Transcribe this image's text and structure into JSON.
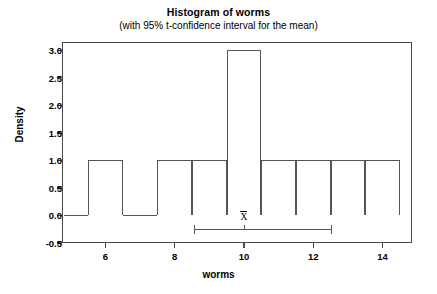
{
  "chart_data": {
    "type": "bar",
    "title": "Histogram of worms",
    "subtitle": "(with 95% t-confidence interval for the mean)",
    "xlabel": "worms",
    "ylabel": "Density",
    "xlim": [
      4.75,
      14.85
    ],
    "ylim": [
      -0.5,
      3.15
    ],
    "grid": false,
    "legend": null,
    "bin_width": 1,
    "bin_edges": [
      5.5,
      6.5,
      7.5,
      8.5,
      9.5,
      10.5,
      11.5,
      12.5,
      13.5,
      14.5
    ],
    "bins": [
      {
        "left": 5.5,
        "right": 6.5,
        "density": 1.0
      },
      {
        "left": 6.5,
        "right": 7.5,
        "density": 0.0
      },
      {
        "left": 7.5,
        "right": 8.5,
        "density": 1.0
      },
      {
        "left": 8.5,
        "right": 9.5,
        "density": 1.0
      },
      {
        "left": 9.5,
        "right": 10.5,
        "density": 3.0
      },
      {
        "left": 10.5,
        "right": 11.5,
        "density": 1.0
      },
      {
        "left": 11.5,
        "right": 12.5,
        "density": 1.0
      },
      {
        "left": 12.5,
        "right": 13.5,
        "density": 1.0
      },
      {
        "left": 13.5,
        "right": 14.5,
        "density": 1.0
      }
    ],
    "categories": [
      "5.5-6.5",
      "6.5-7.5",
      "7.5-8.5",
      "8.5-9.5",
      "9.5-10.5",
      "10.5-11.5",
      "11.5-12.5",
      "12.5-13.5",
      "13.5-14.5"
    ],
    "values": [
      1.0,
      0.0,
      1.0,
      1.0,
      3.0,
      1.0,
      1.0,
      1.0,
      1.0
    ],
    "xticks": [
      6,
      8,
      10,
      12,
      14
    ],
    "xtick_labels": [
      "6",
      "8",
      "10",
      "12",
      "14"
    ],
    "yticks": [
      -0.5,
      0.0,
      0.5,
      1.0,
      1.5,
      2.0,
      2.5,
      3.0
    ],
    "ytick_labels": [
      "-0.5",
      "0.0",
      "0.5",
      "1.0",
      "1.5",
      "2.0",
      "2.5",
      "3.0"
    ],
    "annotations": {
      "confidence_interval": {
        "label": "X̄",
        "mean": 10.0,
        "lower": 8.55,
        "upper": 12.5,
        "level": "95%",
        "y_position": -0.25
      }
    },
    "colors": {
      "bar_stroke": "#555555",
      "axis": "#4a4a4a",
      "text": "#000000",
      "background": "#ffffff"
    }
  }
}
